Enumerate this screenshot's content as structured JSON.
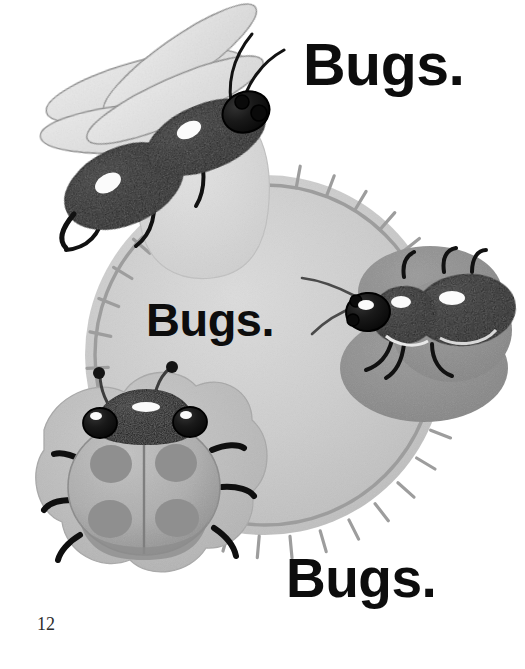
{
  "page": {
    "width": 525,
    "height": 669,
    "background_color": "#ffffff",
    "page_number": "12",
    "kind": "picture-book-page"
  },
  "texts": [
    {
      "id": "word-top",
      "text": "Bugs.",
      "x": 303,
      "y": 36,
      "font_size": 59,
      "color": "#0d0d0d"
    },
    {
      "id": "word-mid",
      "text": "Bugs.",
      "x": 146,
      "y": 296,
      "font_size": 47,
      "color": "#0d0d0d"
    },
    {
      "id": "word-bottom",
      "text": "Bugs.",
      "x": 286,
      "y": 551,
      "font_size": 55,
      "color": "#0d0d0d"
    }
  ],
  "illustration": {
    "title": "Three bugs on a stitched felt circle",
    "palette": {
      "paper_white": "#ffffff",
      "felt_circle": "#c9c9c9",
      "felt_circle_light": "#d5d5d5",
      "stitch_gray": "#9a9a9a",
      "pale_blob": "#d9d9d9",
      "mid_gray_blob": "#8e8e8e",
      "flower_blob": "#bfbfbf",
      "ladybug_body": "#b0b0b0",
      "ladybug_spot": "#8e8e8e",
      "bug_black": "#111111",
      "bug_highlight": "#fafafa",
      "wing_fill": "#e3e3e3",
      "wing_outline": "#8d8d8d",
      "outline_dark": "#3a3a3a"
    },
    "elements": [
      {
        "name": "felt-circle",
        "shape": "circle",
        "cx": 265,
        "cy": 355,
        "r": 180,
        "fill": "#c9c9c9",
        "stitches": 34
      },
      {
        "name": "pale-blob-top",
        "shape": "rounded-blob",
        "cx": 205,
        "cy": 200,
        "fill": "#d9d9d9"
      },
      {
        "name": "gray-blob-right",
        "shape": "oval-pair",
        "cx": 425,
        "cy": 330,
        "fill": "#8e8e8e"
      },
      {
        "name": "flower-blob-bottom-left",
        "shape": "flower",
        "cx": 140,
        "cy": 485,
        "fill": "#bfbfbf"
      },
      {
        "name": "firefly-top-left",
        "type": "winged-beetle",
        "wings": 4,
        "antennae": 2,
        "legs": 3,
        "eyes": 2
      },
      {
        "name": "beetle-right",
        "type": "three-segment-beetle",
        "segments": 3,
        "antennae": 2,
        "legs": 4,
        "eyes": 2
      },
      {
        "name": "ladybug-bottom-left",
        "type": "ladybug",
        "spots": 4,
        "antennae": 2,
        "legs": 6,
        "eyes": 2
      }
    ]
  }
}
